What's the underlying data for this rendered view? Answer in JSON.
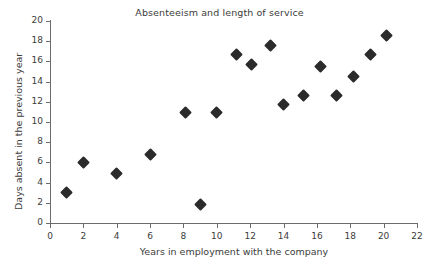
{
  "chart_data": {
    "type": "scatter",
    "title": "Absenteeism and length of service",
    "xlabel": "Years in employment with the company",
    "ylabel": "Days absent in the previous year",
    "xlim": [
      0,
      22
    ],
    "ylim": [
      0,
      20
    ],
    "xticks": [
      0,
      2,
      4,
      6,
      8,
      10,
      12,
      14,
      16,
      18,
      20,
      22
    ],
    "yticks": [
      0,
      2,
      4,
      6,
      8,
      10,
      12,
      14,
      16,
      18,
      20
    ],
    "grid": false,
    "legend": false,
    "marker": "diamond",
    "marker_color": "#2b2b2b",
    "axis_color": "#6b6b6b",
    "text_color": "#3c3c3c",
    "points": [
      {
        "x": 1.0,
        "y": 3.0
      },
      {
        "x": 2.0,
        "y": 6.0
      },
      {
        "x": 4.0,
        "y": 4.9
      },
      {
        "x": 6.0,
        "y": 6.8
      },
      {
        "x": 8.1,
        "y": 10.9
      },
      {
        "x": 9.0,
        "y": 1.8
      },
      {
        "x": 10.0,
        "y": 10.9
      },
      {
        "x": 11.2,
        "y": 16.7
      },
      {
        "x": 12.1,
        "y": 15.7
      },
      {
        "x": 13.2,
        "y": 17.6
      },
      {
        "x": 14.0,
        "y": 11.7
      },
      {
        "x": 15.2,
        "y": 12.6
      },
      {
        "x": 16.2,
        "y": 15.5
      },
      {
        "x": 17.2,
        "y": 12.6
      },
      {
        "x": 18.2,
        "y": 14.5
      },
      {
        "x": 19.2,
        "y": 16.7
      },
      {
        "x": 20.2,
        "y": 18.6
      }
    ]
  }
}
